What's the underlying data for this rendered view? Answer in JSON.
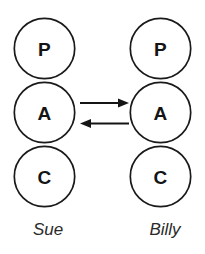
{
  "diagram": {
    "type": "transactional-analysis-pac",
    "background_color": "#ffffff",
    "stroke_color": "#1a1a1a",
    "persons": [
      {
        "id": "sue",
        "name": "Sue",
        "side": "left",
        "ego_states": [
          {
            "code": "P",
            "name": "Parent"
          },
          {
            "code": "A",
            "name": "Adult"
          },
          {
            "code": "C",
            "name": "Child"
          }
        ]
      },
      {
        "id": "billy",
        "name": "Billy",
        "side": "right",
        "ego_states": [
          {
            "code": "P",
            "name": "Parent"
          },
          {
            "code": "A",
            "name": "Adult"
          },
          {
            "code": "C",
            "name": "Child"
          }
        ]
      }
    ],
    "transactions": [
      {
        "id": "stimulus",
        "direction": "right",
        "from": "sue-adult",
        "to": "billy-adult",
        "label": ""
      },
      {
        "id": "response",
        "direction": "left",
        "from": "billy-adult",
        "to": "sue-adult",
        "label": ""
      }
    ]
  }
}
